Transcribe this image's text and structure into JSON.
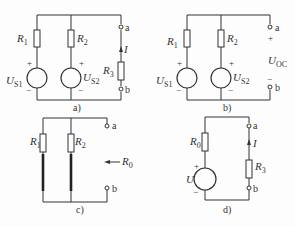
{
  "figure": {
    "panels": [
      {
        "id": "a",
        "caption": "a)",
        "labels": {
          "R1": "R",
          "R1_sub": "1",
          "R2": "R",
          "R2_sub": "2",
          "US1": "U",
          "US1_sub": "S1",
          "US2": "U",
          "US2_sub": "S2",
          "R3": "R",
          "R3_sub": "3",
          "I": "I",
          "term_a": "a",
          "term_b": "b",
          "plus": "+",
          "minus": "−"
        }
      },
      {
        "id": "b",
        "caption": "b)",
        "labels": {
          "R1": "R",
          "R1_sub": "1",
          "R2": "R",
          "R2_sub": "2",
          "US1": "U",
          "US1_sub": "S1",
          "US2": "U",
          "US2_sub": "S2",
          "UOC": "U",
          "UOC_sub": "OC",
          "term_a": "a",
          "term_b": "b",
          "plus": "+",
          "minus": "−"
        }
      },
      {
        "id": "c",
        "caption": "c)",
        "labels": {
          "R1": "R",
          "R1_sub": "1",
          "R2": "R",
          "R2_sub": "2",
          "R0": "R",
          "R0_sub": "0",
          "term_a": "a",
          "term_b": "b"
        }
      },
      {
        "id": "d",
        "caption": "d)",
        "labels": {
          "R0": "R",
          "R0_sub": "0",
          "U": "U",
          "R3": "R",
          "R3_sub": "3",
          "I": "I",
          "term_a": "a",
          "term_b": "b",
          "plus": "+",
          "minus": "−"
        }
      }
    ],
    "colors": {
      "line": "#333333",
      "background": "#fdfdfd"
    }
  }
}
